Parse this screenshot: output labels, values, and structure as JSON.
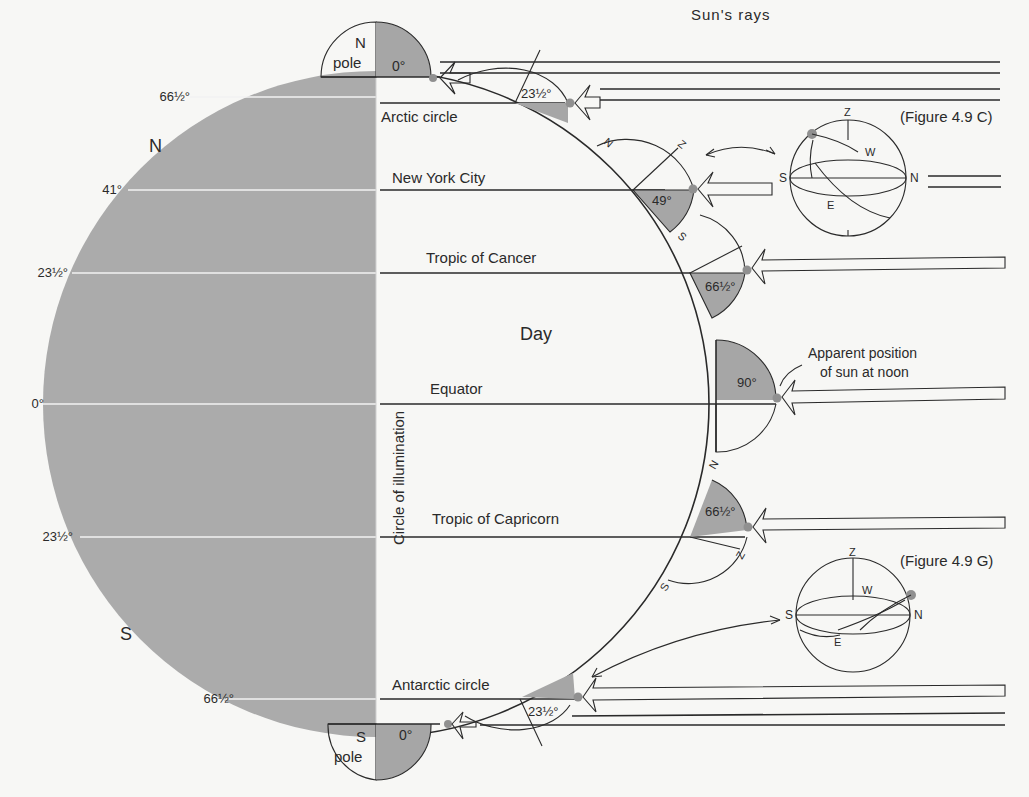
{
  "diagram": {
    "title": "Sun's rays",
    "center_label": "Day",
    "circle_label": "Circle of illumination",
    "hemisphere_labels": {
      "north": "N",
      "south": "S"
    },
    "left_latitudes": [
      {
        "label": "66½°",
        "y": 97
      },
      {
        "label": "41°",
        "y": 190
      },
      {
        "label": "23½°",
        "y": 273
      },
      {
        "label": "0°",
        "y": 404
      },
      {
        "label": "23½°",
        "y": 537
      },
      {
        "label": "66½°",
        "y": 699
      }
    ],
    "parallels": [
      {
        "name": "Arctic circle",
        "sun_angle": "23½°"
      },
      {
        "name": "New York City",
        "sun_angle": "49°"
      },
      {
        "name": "Tropic of Cancer",
        "sun_angle": "66½°"
      },
      {
        "name": "Equator",
        "sun_angle": "90°"
      },
      {
        "name": "Tropic of Capricorn",
        "sun_angle": "66½°"
      },
      {
        "name": "Antarctic circle",
        "sun_angle": "23½°"
      }
    ],
    "poles": {
      "north": {
        "line1": "N",
        "line2": "pole",
        "angle": "0°"
      },
      "south": {
        "line1": "S",
        "line2": "pole",
        "angle": "0°"
      }
    },
    "annotation": {
      "line1": "Apparent position",
      "line2": "of sun at noon"
    },
    "figure_refs": {
      "top": "(Figure 4.9 C)",
      "bottom": "(Figure 4.9 G)"
    },
    "compass": {
      "zenith": "Z",
      "north": "N",
      "south": "S",
      "east": "E",
      "west": "W"
    },
    "colors": {
      "night_shade": "#ababab",
      "sector_shade": "#a6a6a6",
      "sun_dot": "#909090",
      "ink": "#2a2a2a",
      "paper": "#f7f7f5"
    }
  }
}
